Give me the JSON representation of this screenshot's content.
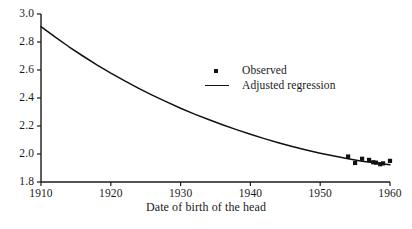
{
  "chart_data": {
    "type": "line",
    "title": "",
    "xlabel": "Date of birth of the head",
    "ylabel": "",
    "xlim": [
      1910,
      1960
    ],
    "ylim": [
      1.8,
      3.0
    ],
    "xticks": [
      1910,
      1920,
      1930,
      1940,
      1950,
      1960
    ],
    "xtick_labels": [
      "1910",
      "1920",
      "1930",
      "1940",
      "1950",
      "1960"
    ],
    "yticks": [
      1.8,
      2.0,
      2.2,
      2.4,
      2.6,
      2.8,
      3.0
    ],
    "ytick_labels": [
      "1.8",
      "2.0",
      "2.2",
      "2.4",
      "2.6",
      "2.8",
      "3.0"
    ],
    "grid": false,
    "legend_position": "upper right inside",
    "series": [
      {
        "name": "Observed",
        "type": "scatter",
        "marker": "square",
        "color": "#111111",
        "x": [
          1954,
          1955,
          1956,
          1957,
          1957.6,
          1958,
          1958.6,
          1959,
          1960
        ],
        "values": [
          1.982,
          1.936,
          1.966,
          1.958,
          1.941,
          1.938,
          1.927,
          1.933,
          1.951
        ]
      },
      {
        "name": "Adjusted regression",
        "type": "line",
        "color": "#111111",
        "x": [
          1910,
          1912,
          1914,
          1916,
          1918,
          1920,
          1922,
          1924,
          1926,
          1928,
          1930,
          1932,
          1934,
          1936,
          1938,
          1940,
          1942,
          1944,
          1946,
          1948,
          1950,
          1952,
          1954,
          1956,
          1958,
          1960
        ],
        "values": [
          2.91,
          2.836,
          2.766,
          2.7,
          2.637,
          2.578,
          2.522,
          2.469,
          2.419,
          2.372,
          2.327,
          2.285,
          2.246,
          2.209,
          2.174,
          2.141,
          2.11,
          2.081,
          2.054,
          2.029,
          2.006,
          1.985,
          1.966,
          1.949,
          1.935,
          1.923
        ]
      }
    ]
  },
  "legend": {
    "entries": [
      {
        "label": "Observed",
        "key": "square-marker"
      },
      {
        "label": "Adjusted regression",
        "key": "line-marker"
      }
    ]
  }
}
